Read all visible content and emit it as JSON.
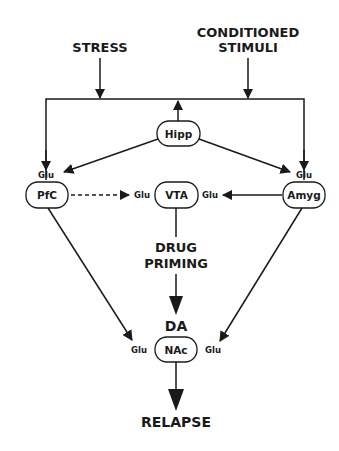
{
  "diagram": {
    "inputs": {
      "stress": "STRESS",
      "conditioned_line1": "CONDITIONED",
      "conditioned_line2": "STIMULI"
    },
    "nodes": {
      "hipp": "Hipp",
      "pfc": "PfC",
      "vta": "VTA",
      "amyg": "Amyg",
      "nac": "NAc"
    },
    "neurotransmitters": {
      "glu": "Glu",
      "da": "DA"
    },
    "drug_priming_line1": "DRUG",
    "drug_priming_line2": "PRIMING",
    "outcome": "RELAPSE",
    "edges": [
      {
        "from": "STRESS",
        "to": "top-bus",
        "style": "solid"
      },
      {
        "from": "CONDITIONED STIMULI",
        "to": "top-bus",
        "style": "solid"
      },
      {
        "from": "Hipp",
        "to": "top-bus",
        "style": "solid"
      },
      {
        "from": "top-bus",
        "to": "PfC",
        "label": "Glu",
        "style": "solid"
      },
      {
        "from": "top-bus",
        "to": "Amyg",
        "label": "Glu",
        "style": "solid"
      },
      {
        "from": "Hipp",
        "to": "PfC",
        "label": "Glu",
        "style": "solid"
      },
      {
        "from": "Hipp",
        "to": "Amyg",
        "label": "Glu",
        "style": "solid"
      },
      {
        "from": "PfC",
        "to": "VTA",
        "label": "Glu",
        "style": "dashed"
      },
      {
        "from": "Amyg",
        "to": "VTA",
        "label": "Glu",
        "style": "solid"
      },
      {
        "from": "VTA",
        "to": "NAc",
        "label": "DA",
        "via": "DRUG PRIMING",
        "style": "bold"
      },
      {
        "from": "PfC",
        "to": "NAc",
        "label": "Glu",
        "style": "solid"
      },
      {
        "from": "Amyg",
        "to": "NAc",
        "label": "Glu",
        "style": "solid"
      },
      {
        "from": "NAc",
        "to": "RELAPSE",
        "style": "bold"
      }
    ]
  }
}
